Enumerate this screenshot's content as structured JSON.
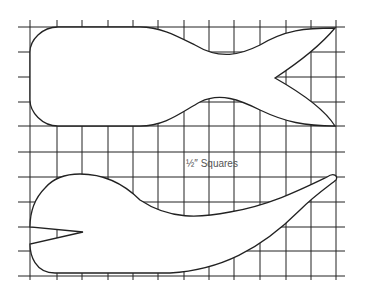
{
  "diagram": {
    "grid_label": "½″ Squares",
    "grid": {
      "x_lines": [
        30,
        57,
        82,
        108,
        133,
        158,
        184,
        209,
        234,
        260,
        286,
        311,
        336
      ],
      "y_lines": [
        27,
        52,
        77,
        102,
        126,
        152,
        177,
        202,
        227,
        251,
        276
      ],
      "color": "#222222"
    },
    "pieces": [
      {
        "name": "whale-body-top",
        "description": "Whale body with forked tail"
      },
      {
        "name": "whale-body-bottom",
        "description": "Whale body with open mouth notch and curved tail"
      }
    ],
    "stroke_color": "#222222"
  }
}
